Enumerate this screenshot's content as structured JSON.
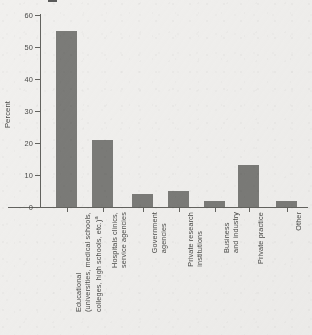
{
  "chart_data": {
    "type": "bar",
    "title": "",
    "xlabel": "",
    "ylabel": "Percent",
    "ylim": [
      0,
      60
    ],
    "yticks": [
      0,
      10,
      20,
      30,
      40,
      50,
      60
    ],
    "ytick_labels": [
      "0",
      "10",
      "20",
      "30",
      "40",
      "50",
      "60"
    ],
    "grid": false,
    "legend": "none",
    "bar_color": "#7b7b78",
    "background_color": "#f1f0ee",
    "axis_color": "#63635f",
    "categories": [
      "Educational (universities, medical schools, colleges, high schools, etc.)",
      "Hospitals clinics, service agencies",
      "Government agencies",
      "Private research institutions",
      "Business and industry",
      "Private practice",
      "Other"
    ],
    "category_lines": [
      [
        "Educational",
        "(universities, medical schools,",
        "colleges, high schools, etc.)"
      ],
      [
        "Hospitals clinics,",
        "service agencies"
      ],
      [
        "Government",
        "agencies"
      ],
      [
        "Private research",
        "institutions"
      ],
      [
        "Business",
        "and industry"
      ],
      [
        "Private practice"
      ],
      [
        "Other"
      ]
    ],
    "category_footnote_markers": [
      "a",
      "",
      "",
      "",
      "",
      "",
      ""
    ],
    "values": [
      55,
      21,
      4,
      5,
      2,
      13,
      2
    ],
    "value_unit": "percent"
  },
  "y_axis": {
    "title": "Percent"
  }
}
